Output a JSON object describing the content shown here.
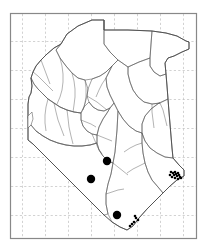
{
  "figure": {
    "frame_color": "#888888",
    "grid_color": "#bfbfbf",
    "boundary_color": "#555555",
    "coast_color": "#333333",
    "point_color": "#000000",
    "background_color": "#ffffff"
  },
  "frame": {
    "x": 10,
    "y": 13,
    "width": 186,
    "height": 225
  },
  "grid": {
    "style": "dashed",
    "vertical_lines": [
      22,
      45,
      68,
      91,
      114,
      137,
      160,
      183
    ],
    "horizontal_lines": [
      41,
      70,
      99,
      128,
      157,
      186,
      215
    ]
  },
  "chart_data": {
    "type": "scatter",
    "xlabel": "",
    "ylabel": "",
    "points_large": [
      {
        "x": 107,
        "y": 161,
        "r": 4.2
      },
      {
        "x": 91,
        "y": 179,
        "r": 4.2
      },
      {
        "x": 117,
        "y": 215,
        "r": 4.2
      }
    ],
    "points_small": [
      {
        "x": 171,
        "y": 172,
        "r": 1.3
      },
      {
        "x": 173,
        "y": 173,
        "r": 1.3
      },
      {
        "x": 174,
        "y": 175,
        "r": 1.3
      },
      {
        "x": 175,
        "y": 172,
        "r": 1.3
      },
      {
        "x": 176,
        "y": 174,
        "r": 1.3
      },
      {
        "x": 177,
        "y": 176,
        "r": 1.3
      },
      {
        "x": 178,
        "y": 173,
        "r": 1.3
      },
      {
        "x": 179,
        "y": 175,
        "r": 1.3
      },
      {
        "x": 180,
        "y": 177,
        "r": 1.3
      },
      {
        "x": 181,
        "y": 178,
        "r": 1.3
      },
      {
        "x": 178,
        "y": 179,
        "r": 1.3
      },
      {
        "x": 175,
        "y": 178,
        "r": 1.3
      },
      {
        "x": 172,
        "y": 177,
        "r": 1.3
      },
      {
        "x": 170,
        "y": 175,
        "r": 1.3
      },
      {
        "x": 136,
        "y": 218,
        "r": 1.3
      },
      {
        "x": 138,
        "y": 220,
        "r": 1.3
      },
      {
        "x": 134,
        "y": 222,
        "r": 1.3
      },
      {
        "x": 132,
        "y": 224,
        "r": 1.3
      },
      {
        "x": 130,
        "y": 226,
        "r": 1.3
      },
      {
        "x": 135,
        "y": 216,
        "r": 1.3
      }
    ]
  },
  "outline": {
    "country_path": "M 61,44 L 67,34 L 78,26 L 92,20 L 104,20 L 104,30 L 128,30 L 152,31 L 166,33 L 177,36 L 186,41 L 189,42 L 189,49 L 182,52 L 174,56 L 168,58 L 165,63 L 166,74 L 167,86 L 168,99 L 169,112 L 170,124 L 171,136 L 172,148 L 173,158 L 179,165 L 184,170 L 184,176 L 177,180 L 170,186 L 163,193 L 155,201 L 147,209 L 139,218 L 133,226 L 127,230 L 120,227 L 112,222 L 104,215 L 97,208 L 89,200 L 81,192 L 73,184 L 65,176 L 57,168 L 49,160 L 41,152 L 33,144 L 28,140 L 28,128 L 28,116 L 28,104 L 29,97 L 31,93 L 32,86 L 31,78 L 33,72 L 36,66 L 41,60 L 47,54 L 54,48 Z",
    "districts": [
      "M 104,20 L 104,30 L 128,30 L 152,31 L 151,44 L 150,58 L 139,62 L 128,67 L 118,60 L 110,52 L 104,44 Z",
      "M 152,31 L 166,33 L 177,36 L 186,41 L 189,42 L 189,49 L 182,52 L 174,56 L 168,58 L 165,63 L 166,74 L 160,76 L 154,72 L 150,66 L 150,58 L 151,44 Z",
      "M 61,44 L 67,34 L 78,26 L 92,20 L 104,20 L 104,44 L 110,52 L 118,60 L 112,66 L 106,72 L 100,76 L 92,79 L 85,80 L 78,78 L 72,73 L 66,66 L 60,58 L 56,50 Z",
      "M 128,67 L 139,62 L 150,58 L 150,66 L 154,72 L 160,76 L 166,74 L 167,86 L 168,99 L 160,103 L 152,104 L 144,102 L 138,97 L 133,90 L 130,82 L 128,74 Z",
      "M 168,99 L 169,112 L 170,124 L 171,136 L 172,148 L 173,158 L 165,157 L 157,153 L 150,148 L 145,141 L 142,133 L 142,124 L 145,116 L 151,109 L 159,103 Z",
      "M 112,66 L 118,60 L 128,67 L 128,74 L 130,82 L 133,90 L 138,97 L 144,102 L 152,104 L 160,103 L 159,103 L 151,109 L 145,116 L 142,124 L 142,133 L 136,131 L 129,126 L 123,119 L 118,111 L 114,103 L 110,95 L 107,87 L 106,78 Z",
      "M 92,79 L 100,76 L 106,72 L 112,66 L 106,78 L 107,87 L 110,95 L 114,103 L 110,108 L 104,111 L 98,110 L 93,107 L 89,102 L 87,96 L 88,89 Z",
      "M 142,133 L 145,141 L 150,148 L 157,153 L 165,157 L 173,158 L 179,165 L 184,170 L 184,176 L 177,180 L 170,186 L 163,193 L 158,187 L 152,180 L 148,172 L 145,163 L 143,153 L 142,143 Z",
      "M 118,111 L 123,119 L 129,126 L 136,131 L 142,133 L 142,143 L 143,153 L 145,163 L 148,172 L 152,180 L 158,187 L 163,193 L 155,201 L 147,209 L 139,218 L 133,226 L 127,230 L 120,227 L 112,222 L 108,214 L 106,204 L 106,194 L 108,184 L 111,174 L 113,163 L 115,152 L 116,141 L 117,130 Z",
      "M 110,108 L 114,103 L 118,111 L 117,130 L 116,141 L 115,152 L 113,163 L 108,161 L 103,156 L 99,150 L 97,143 L 97,135 L 99,127 L 103,119 L 107,113 Z",
      "M 89,102 L 93,107 L 98,110 L 104,111 L 110,108 L 107,113 L 103,119 L 99,127 L 97,135 L 92,134 L 87,131 L 83,126 L 81,120 L 81,113 L 84,107 Z",
      "M 31,78 L 33,72 L 36,66 L 41,60 L 47,54 L 54,48 L 61,44 L 56,50 L 60,58 L 66,66 L 72,73 L 78,78 L 85,80 L 88,89 L 87,96 L 84,107 L 81,113 L 74,112 L 67,110 L 60,107 L 54,103 L 48,99 L 43,94 L 38,89 L 34,84 Z",
      "M 28,104 L 29,97 L 31,93 L 32,86 L 31,78 L 34,84 L 38,89 L 43,94 L 48,99 L 54,103 L 60,107 L 67,110 L 74,112 L 81,113 L 81,120 L 83,126 L 87,131 L 92,134 L 97,135 L 97,143 L 90,145 L 82,146 L 74,146 L 66,145 L 58,143 L 50,140 L 43,136 L 36,131 L 31,125 L 28,118 Z",
      "M 28,128 L 28,140 L 33,144 L 41,152 L 49,160 L 57,168 L 65,176 L 73,184 L 81,192 L 89,200 L 97,208 L 104,215 L 108,214 L 106,204 L 106,194 L 108,184 L 111,174 L 113,163 L 108,161 L 103,156 L 99,150 L 97,143 L 90,145 L 82,146 L 74,146 L 66,145 L 58,143 L 50,140 L 43,136 L 36,131 L 31,125 Z"
    ],
    "district_detail": [
      "M 36,131 L 43,136 L 50,140 L 58,143 L 66,145 L 74,146 L 82,146 L 90,145 L 97,143",
      "M 43,94 L 48,99 L 54,103 L 60,107 L 67,110 L 74,112 L 81,113",
      "M 54,103 L 56,112 L 58,120 L 61,128 L 64,136",
      "M 67,110 L 68,118 L 69,127 L 71,136 L 73,144",
      "M 48,99 L 46,107 L 45,115 L 45,123 L 46,131",
      "M 60,58 L 62,66 L 63,74 L 63,82 L 62,90 L 60,97 L 57,104",
      "M 72,73 L 74,81 L 75,89 L 75,97 L 74,105 L 73,112",
      "M 85,80 L 86,88 L 86,96 L 85,103 L 83,110",
      "M 92,134 L 95,141 L 98,148 L 102,154",
      "M 81,120 L 86,122 L 91,124 L 96,127",
      "M 87,96 L 92,99 L 97,102 L 102,106 L 107,110",
      "M 97,135 L 102,137 L 107,139 L 112,141",
      "M 106,78 L 102,84 L 99,90 L 96,97",
      "M 33,72 L 38,76 L 43,81 L 48,86 L 53,91",
      "M 41,60 L 44,68 L 47,76 L 50,84",
      "M 113,163 L 118,167 L 123,171 L 128,175",
      "M 106,194 L 112,192 L 118,190 L 124,189",
      "M 145,163 L 139,166 L 133,169 L 127,173",
      "M 142,143 L 136,145 L 130,148 L 124,152",
      "M 152,104 L 152,112 L 153,120 L 154,128",
      "M 160,103 L 163,110 L 165,118 L 167,126"
    ],
    "lake_victoria": "M 28,116 L 28,128 L 31,125 L 33,119 L 32,112 Z"
  }
}
